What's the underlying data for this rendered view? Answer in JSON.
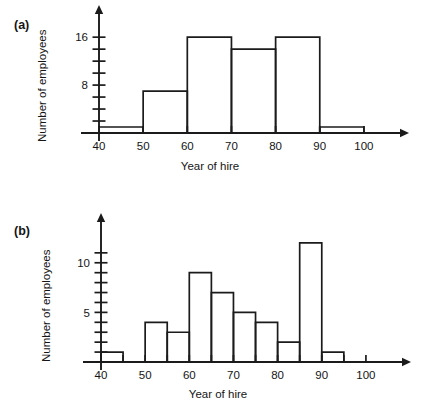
{
  "figure": {
    "background_color": "#ffffff",
    "ink_color": "#1b1b1b"
  },
  "panels": [
    {
      "key": "a",
      "label": "(a)",
      "xlabel": "Year of hire",
      "ylabel": "Number of employees"
    },
    {
      "key": "b",
      "label": "(b)",
      "xlabel": "Year of hire",
      "ylabel": "Number of employees"
    }
  ],
  "chart_data": [
    {
      "type": "bar",
      "panel": "a",
      "title": "(a)",
      "xlabel": "Year of hire",
      "ylabel": "Number of employees",
      "bin_width": 10,
      "bin_edges": [
        40,
        50,
        60,
        70,
        80,
        90,
        100
      ],
      "categories": [
        "40-50",
        "50-60",
        "60-70",
        "70-80",
        "80-90",
        "90-100"
      ],
      "values": [
        1,
        7,
        16,
        14,
        16,
        1
      ],
      "xlim": [
        40,
        105
      ],
      "ylim": [
        0,
        18
      ],
      "x_tick_values": [
        40,
        50,
        60,
        70,
        80,
        90,
        100
      ],
      "x_tick_labels": [
        "40",
        "50",
        "60",
        "70",
        "80",
        "90",
        "100"
      ],
      "y_tick_values": [
        0,
        2,
        4,
        6,
        8,
        10,
        12,
        14,
        16
      ],
      "y_labeled_ticks": [
        8,
        16
      ],
      "y_tick_labels": [
        "8",
        "16"
      ],
      "grid": false,
      "legend": "none"
    },
    {
      "type": "bar",
      "panel": "b",
      "title": "(b)",
      "xlabel": "Year of hire",
      "ylabel": "Number of employees",
      "bin_width": 5,
      "bin_edges": [
        40,
        45,
        50,
        55,
        60,
        65,
        70,
        75,
        80,
        85,
        90,
        95,
        100
      ],
      "categories": [
        "40-45",
        "45-50",
        "50-55",
        "55-60",
        "60-65",
        "65-70",
        "70-75",
        "75-80",
        "80-85",
        "85-90",
        "90-95",
        "95-100"
      ],
      "values": [
        1,
        0,
        4,
        3,
        9,
        7,
        5,
        4,
        2,
        12,
        1,
        0
      ],
      "xlim": [
        40,
        105
      ],
      "ylim": [
        0,
        13
      ],
      "x_tick_values": [
        40,
        45,
        50,
        55,
        60,
        65,
        70,
        75,
        80,
        85,
        90,
        95,
        100
      ],
      "x_tick_labels": [
        "40",
        "",
        "50",
        "",
        "60",
        "",
        "70",
        "",
        "80",
        "",
        "90",
        "",
        "100"
      ],
      "y_tick_values": [
        0,
        1,
        2,
        3,
        4,
        5,
        6,
        7,
        8,
        9,
        10,
        11
      ],
      "y_labeled_ticks": [
        5,
        10
      ],
      "y_tick_labels": [
        "5",
        "10"
      ],
      "grid": false,
      "legend": "none"
    }
  ]
}
